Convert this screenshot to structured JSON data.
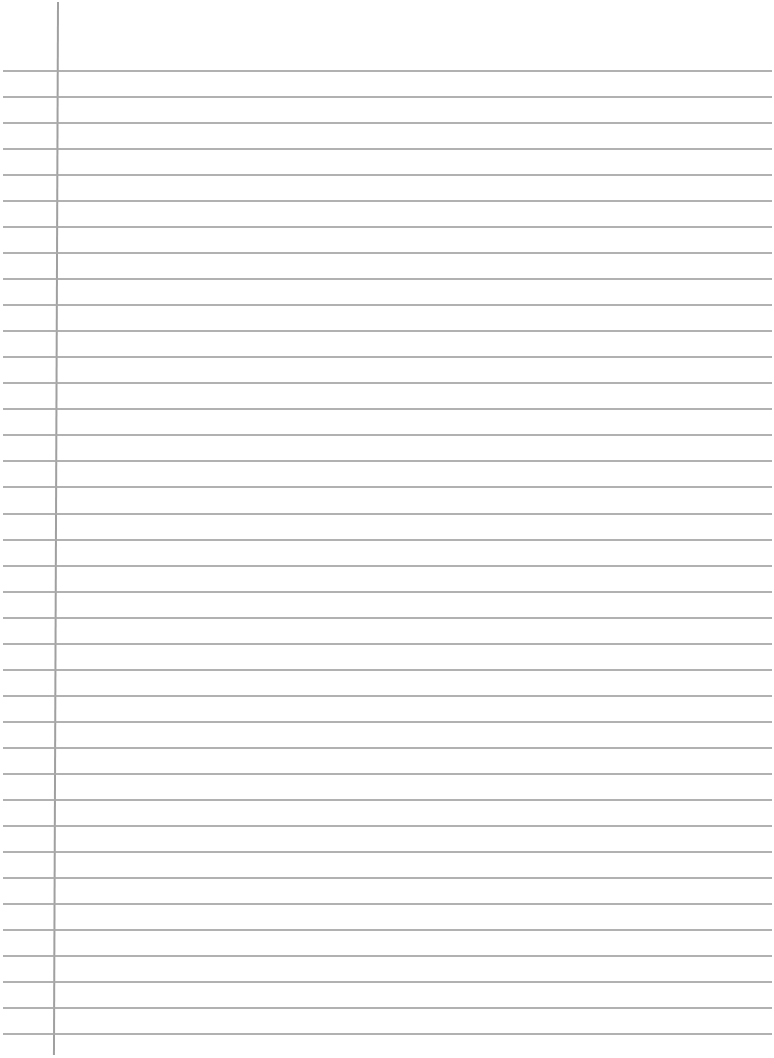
{
  "paper": {
    "type": "ruled-notebook-page",
    "background_color": "#ffffff",
    "line_color": "#a9a9a9",
    "margin_line_color": "#a0a0a0",
    "line_count": 38,
    "first_line_y": 70,
    "line_spacing": 26.03,
    "margin_line_x": 57,
    "text": ""
  }
}
